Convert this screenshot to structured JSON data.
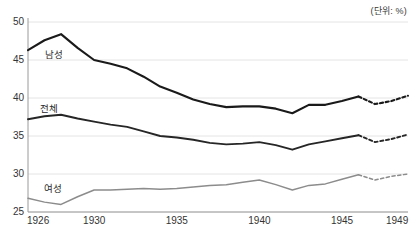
{
  "unit_note": "(단위: %)",
  "axis": {
    "y_ticks": [
      "50",
      "45",
      "40",
      "35",
      "30",
      "25"
    ],
    "x_ticks": [
      "1926",
      "1930",
      "1935",
      "1940",
      "1945",
      "1949"
    ]
  },
  "series_labels": {
    "male": "남성",
    "total": "전체",
    "female": "여성"
  },
  "colors": {
    "male": "#1a1a1a",
    "total": "#262626",
    "female": "#8c8c8c",
    "grid": "#e4e4e4",
    "axis": "#9a9a9a",
    "text": "#333333"
  },
  "chart_data": {
    "type": "line",
    "title": "",
    "subtitle": "",
    "xlabel": "",
    "ylabel": "",
    "unit": "(단위: %)",
    "xlim": [
      1926,
      1949
    ],
    "ylim": [
      25,
      50
    ],
    "y_ticks": [
      25,
      30,
      35,
      40,
      45,
      50
    ],
    "x_ticks": [
      1926,
      1930,
      1935,
      1940,
      1945,
      1949
    ],
    "grid": true,
    "legend": "inline-labels",
    "x": [
      1926,
      1927,
      1928,
      1929,
      1930,
      1931,
      1932,
      1933,
      1934,
      1935,
      1936,
      1937,
      1938,
      1939,
      1940,
      1941,
      1942,
      1943,
      1944,
      1945,
      1946,
      1947,
      1948,
      1949
    ],
    "forecast_start_year": 1946,
    "series": [
      {
        "name": "남성",
        "color": "#1a1a1a",
        "values": [
          46.3,
          47.6,
          48.4,
          46.6,
          45.0,
          44.5,
          43.9,
          42.8,
          41.5,
          40.7,
          39.8,
          39.2,
          38.8,
          38.9,
          38.9,
          38.6,
          38.0,
          39.1,
          39.1,
          39.6,
          40.2,
          39.2,
          39.6,
          40.3
        ]
      },
      {
        "name": "전체",
        "color": "#262626",
        "values": [
          37.2,
          37.6,
          37.8,
          37.3,
          36.9,
          36.5,
          36.2,
          35.6,
          35.0,
          34.8,
          34.5,
          34.1,
          33.9,
          34.0,
          34.2,
          33.8,
          33.2,
          33.9,
          34.3,
          34.7,
          35.1,
          34.2,
          34.6,
          35.2
        ]
      },
      {
        "name": "여성",
        "color": "#8c8c8c",
        "values": [
          26.8,
          26.3,
          26.0,
          27.0,
          27.9,
          27.9,
          28.0,
          28.1,
          28.0,
          28.1,
          28.3,
          28.5,
          28.6,
          28.9,
          29.2,
          28.6,
          27.9,
          28.5,
          28.7,
          29.3,
          29.9,
          29.2,
          29.7,
          30.0
        ]
      }
    ]
  }
}
